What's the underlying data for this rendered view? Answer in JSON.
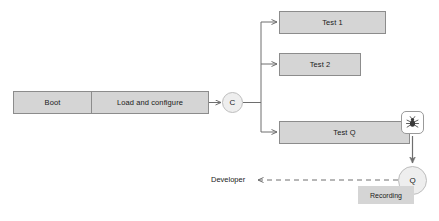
{
  "diagram": {
    "colors": {
      "box_fill": "#d5d5d5",
      "box_border": "#8c8c8c",
      "circle_fill": "#eeeeee",
      "circle_border": "#bdbdbd",
      "edge": "#6e6e6e",
      "background": "#ffffff",
      "badge_fill": "#ffffff",
      "bug_glyph": "#3a3a3a"
    },
    "nodes": {
      "boot": {
        "label": "Boot"
      },
      "load_configure": {
        "label": "Load and configure"
      },
      "controller": {
        "label": "C"
      },
      "test_1": {
        "label": "Test 1"
      },
      "test_2": {
        "label": "Test 2"
      },
      "test_q": {
        "label": "Test Q"
      },
      "bug_badge": {
        "icon": "bug-icon"
      },
      "queue": {
        "label": "Q"
      },
      "recording": {
        "label": "Recording"
      },
      "developer": {
        "label": "Developer"
      }
    },
    "edges": [
      {
        "from": "load_configure",
        "to": "controller",
        "style": "solid",
        "arrow": "open"
      },
      {
        "from": "controller",
        "to": "test_1",
        "style": "solid",
        "arrow": "open"
      },
      {
        "from": "controller",
        "to": "test_2",
        "style": "solid",
        "arrow": "open"
      },
      {
        "from": "controller",
        "to": "test_q",
        "style": "solid",
        "arrow": "open"
      },
      {
        "from": "bug_badge",
        "to": "queue",
        "style": "solid",
        "arrow": "filled"
      },
      {
        "from": "queue",
        "to": "developer",
        "style": "dashed",
        "arrow": "open"
      }
    ]
  }
}
